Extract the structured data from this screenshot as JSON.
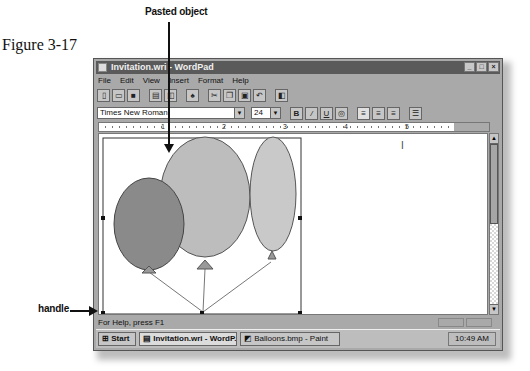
{
  "figure": {
    "label": "Figure 3-17"
  },
  "callouts": {
    "pasted_object": "Pasted object",
    "handle": "handle"
  },
  "window": {
    "title": "Invitation.wri - WordPad",
    "buttons": {
      "minimize": "_",
      "maximize": "□",
      "close": "×"
    }
  },
  "menu": [
    "File",
    "Edit",
    "View",
    "Insert",
    "Format",
    "Help"
  ],
  "toolbar": {
    "buttons": [
      "new",
      "open",
      "save",
      "print",
      "print-preview",
      "find",
      "cut",
      "copy",
      "paste",
      "undo",
      "insert-date-time"
    ]
  },
  "format": {
    "font": "Times New Roman",
    "size": "24",
    "bold": "B",
    "italic": "/",
    "underline": "U"
  },
  "ruler": {
    "numbers": [
      "1",
      "2",
      "3",
      "4",
      "5"
    ]
  },
  "document": {
    "pasted_object": "Balloons image",
    "balloon_colors": {
      "left": "#8a8a8a",
      "middle": "#bdbdbd",
      "right": "#c9c9c9"
    }
  },
  "status": {
    "text": "For Help, press F1"
  },
  "taskbar": {
    "start": "Start",
    "tasks": [
      "Invitation.wri - WordP...",
      "Balloons.bmp - Paint"
    ],
    "clock": "10:49 AM"
  }
}
